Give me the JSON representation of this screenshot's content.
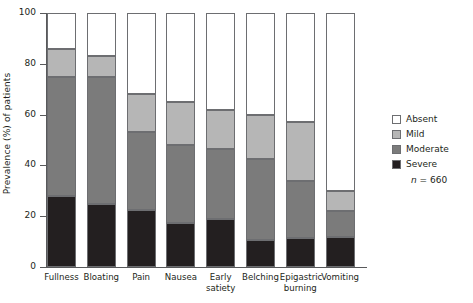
{
  "chart_data": {
    "type": "bar",
    "subtype": "stacked-bar-100",
    "title": "",
    "xlabel": "",
    "ylabel": "Prevalence (%) of patients",
    "ylim": [
      0,
      100
    ],
    "yticks": [
      0,
      20,
      40,
      60,
      80,
      100
    ],
    "ytick_labels": [
      "0",
      "20",
      "40",
      "60",
      "80",
      "100"
    ],
    "grid": false,
    "legend_position": "right",
    "categories": [
      "Fullness",
      "Bloating",
      "Pain",
      "Nausea",
      "Early\nsatiety",
      "Belching",
      "Epigastric\nburning",
      "Vomiting"
    ],
    "series": [
      {
        "name": "Severe",
        "color": "#231f20",
        "values": [
          28,
          25,
          22.5,
          17.5,
          19,
          10.5,
          11.5,
          12
        ]
      },
      {
        "name": "Moderate",
        "color": "#7b7b7b",
        "values": [
          47,
          50,
          30.5,
          30.5,
          27.5,
          32,
          22.5,
          10
        ]
      },
      {
        "name": "Mild",
        "color": "#b6b6b6",
        "values": [
          11,
          8,
          15,
          17,
          15.5,
          17.5,
          23,
          8
        ]
      },
      {
        "name": "Absent",
        "color": "#ffffff",
        "values": [
          14,
          17,
          32,
          35,
          38,
          40,
          43,
          70
        ]
      }
    ],
    "annotations": [
      "n = 660"
    ]
  },
  "legend": {
    "items": [
      {
        "label": "Absent",
        "color": "#ffffff"
      },
      {
        "label": "Mild",
        "color": "#b6b6b6"
      },
      {
        "label": "Moderate",
        "color": "#7b7b7b"
      },
      {
        "label": "Severe",
        "color": "#231f20"
      }
    ],
    "sample_size_prefix": "n",
    "sample_size_value": "= 660"
  }
}
